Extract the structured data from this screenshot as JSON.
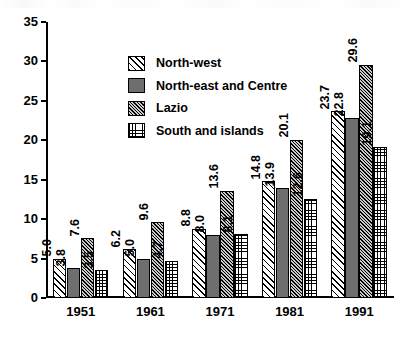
{
  "chart_data": {
    "type": "bar",
    "title": "",
    "xlabel": "",
    "ylabel": "",
    "ylim": [
      0,
      35
    ],
    "yticks": [
      "0",
      "5",
      "10",
      "15",
      "20",
      "25",
      "30",
      "35"
    ],
    "grid": false,
    "legend_position": "upper-left-inside",
    "categories": [
      "1951",
      "1961",
      "1971",
      "1981",
      "1991"
    ],
    "series": [
      {
        "name": "North-west",
        "pattern": "diagonal-hatch",
        "values": [
          5.0,
          6.2,
          8.8,
          14.8,
          23.7
        ],
        "labels": [
          "5.0",
          "6.2",
          "8.8",
          "14.8",
          "23.7"
        ]
      },
      {
        "name": "North-east and Centre",
        "pattern": "solid-gray",
        "values": [
          3.8,
          5.0,
          8.0,
          13.9,
          22.8
        ],
        "labels": [
          "3.8",
          "5.0",
          "8.0",
          "13.9",
          "22.8"
        ]
      },
      {
        "name": "Lazio",
        "pattern": "dense-diagonal-hatch",
        "values": [
          7.6,
          9.6,
          13.6,
          20.1,
          29.6
        ],
        "labels": [
          "7.6",
          "9.6",
          "13.6",
          "20.1",
          "29.6"
        ]
      },
      {
        "name": "South and islands",
        "pattern": "dotted-grid",
        "values": [
          3.5,
          4.7,
          8.1,
          12.6,
          19.1
        ],
        "labels": [
          "3.5",
          "4.7",
          "8.1",
          "12.6",
          "19.1"
        ]
      }
    ]
  },
  "colors": {
    "axis": "#000000",
    "bar_outline": "#000000",
    "series_solid_gray": "#6e6e6e",
    "background": "#ffffff"
  }
}
